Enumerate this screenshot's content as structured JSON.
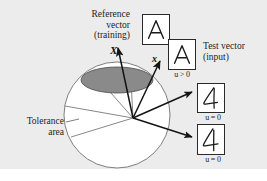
{
  "figure": {
    "kind": "diagram",
    "background_color": "#ececed",
    "ink_color": "#1d1d1d"
  },
  "labels": {
    "reference_vector": "Reference\nvector\n(training)",
    "test_vector": "Test vector\n(input)",
    "tolerance_area": "Tolerance\narea"
  },
  "vectors": [
    {
      "name": "reference-vector",
      "symbol": "X"
    },
    {
      "name": "test-vector",
      "symbol": "x"
    }
  ],
  "activations": {
    "test_accepted": "u > 0",
    "reject_1": "u = 0",
    "reject_2": "u = 0"
  },
  "glyph_boxes": [
    {
      "name": "reference-glyph",
      "glyph": "A",
      "style": "printed",
      "label": "Reference vector (training)"
    },
    {
      "name": "test-glyph",
      "glyph": "A",
      "style": "printed",
      "label": "Test vector (input)",
      "activation": "u > 0"
    },
    {
      "name": "reject-glyph-1",
      "glyph": "A",
      "style": "handwritten",
      "activation": "u = 0"
    },
    {
      "name": "reject-glyph-2",
      "glyph": "4",
      "style": "handwritten",
      "activation": "u = 0"
    }
  ],
  "shapes": {
    "sphere": {
      "name": "unit-sphere",
      "fill": "#ffffff",
      "stroke": "#6f6f6f"
    },
    "tolerance_ellipse": {
      "name": "tolerance-area-ellipse",
      "fill": "#8a8a8a",
      "stroke": "#4a4a4a"
    },
    "cone": {
      "name": "tolerance-cone",
      "stroke": "#7a7a7a"
    }
  }
}
